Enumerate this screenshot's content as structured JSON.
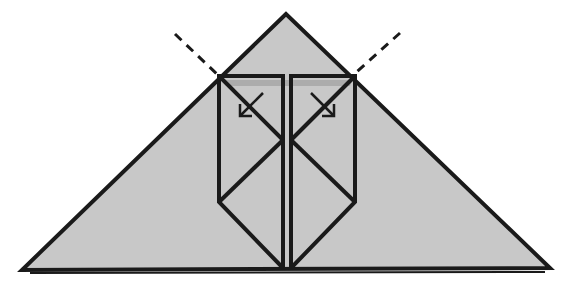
{
  "diagram": {
    "type": "origami-fold-step",
    "colors": {
      "paper": "#c8c8c8",
      "line": "#1a1a1a",
      "shadow": "#8a8a8a",
      "background": "#ffffff"
    },
    "elements": [
      "triangle-base",
      "mountain-fold-dashed-left",
      "mountain-fold-dashed-right",
      "inner-flaps",
      "fold-arrow-left",
      "fold-arrow-right"
    ]
  }
}
